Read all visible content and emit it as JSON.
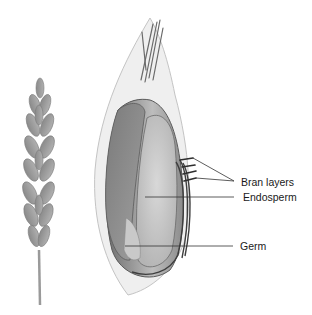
{
  "diagram": {
    "labels": [
      {
        "id": "bran",
        "text": "Bran layers",
        "x": 241,
        "y": 183
      },
      {
        "id": "endosperm",
        "text": "Endosperm",
        "x": 243,
        "y": 192
      },
      {
        "id": "germ",
        "text": "Germ",
        "x": 240,
        "y": 241
      }
    ],
    "signature": "R.T.B",
    "colors": {
      "pencil_dark": "#555555",
      "pencil_mid": "#8a8a8a",
      "pencil_light": "#c8c8c8",
      "leader_line": "#333333",
      "background": "#ffffff"
    }
  }
}
